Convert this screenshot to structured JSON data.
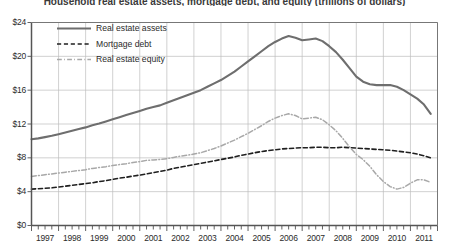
{
  "chart_data": {
    "type": "line",
    "title": "Household real estate assets, mortgage debt, and equity (trillions of dollars)",
    "xlabel": "",
    "ylabel": "",
    "ylim": [
      0,
      24
    ],
    "ytick_labels": [
      "$0",
      "$4",
      "$8",
      "$12",
      "$16",
      "$20",
      "$24"
    ],
    "ytick_values": [
      0,
      4,
      8,
      12,
      16,
      20,
      24
    ],
    "xtick_labels": [
      "1997",
      "1998",
      "1999",
      "2000",
      "2001",
      "2002",
      "2003",
      "2004",
      "2005",
      "2006",
      "2007",
      "2008",
      "2009",
      "2010",
      "2011"
    ],
    "xlim": [
      1997,
      2012
    ],
    "grid": true,
    "minor_ticks_per_year": 4,
    "legend_position": "upper-left-inside",
    "x": [
      1997.0,
      1997.25,
      1997.5,
      1997.75,
      1998.0,
      1998.25,
      1998.5,
      1998.75,
      1999.0,
      1999.25,
      1999.5,
      1999.75,
      2000.0,
      2000.25,
      2000.5,
      2000.75,
      2001.0,
      2001.25,
      2001.5,
      2001.75,
      2002.0,
      2002.25,
      2002.5,
      2002.75,
      2003.0,
      2003.25,
      2003.5,
      2003.75,
      2004.0,
      2004.25,
      2004.5,
      2004.75,
      2005.0,
      2005.25,
      2005.5,
      2005.75,
      2006.0,
      2006.25,
      2006.5,
      2006.75,
      2007.0,
      2007.25,
      2007.5,
      2007.75,
      2008.0,
      2008.25,
      2008.5,
      2008.75,
      2009.0,
      2009.25,
      2009.5,
      2009.75,
      2010.0,
      2010.25,
      2010.5,
      2010.75,
      2011.0,
      2011.25,
      2011.5,
      2011.75
    ],
    "series": [
      {
        "name": "Real estate assets",
        "style": "solid",
        "color": "#6e6e6e",
        "width": 2.1,
        "values": [
          10.2,
          10.3,
          10.45,
          10.6,
          10.8,
          11.0,
          11.2,
          11.4,
          11.6,
          11.85,
          12.05,
          12.3,
          12.55,
          12.8,
          13.05,
          13.3,
          13.55,
          13.8,
          14.0,
          14.2,
          14.5,
          14.8,
          15.1,
          15.4,
          15.7,
          16.0,
          16.4,
          16.8,
          17.2,
          17.7,
          18.2,
          18.8,
          19.4,
          20.0,
          20.6,
          21.2,
          21.7,
          22.1,
          22.4,
          22.2,
          21.9,
          22.0,
          22.1,
          21.8,
          21.2,
          20.5,
          19.6,
          18.6,
          17.6,
          17.0,
          16.7,
          16.6,
          16.6,
          16.6,
          16.4,
          16.0,
          15.5,
          15.0,
          14.3,
          13.2
        ]
      },
      {
        "name": "Mortgage debt",
        "style": "dashed",
        "color": "#1f1f1f",
        "width": 1.6,
        "values": [
          4.3,
          4.35,
          4.4,
          4.45,
          4.55,
          4.65,
          4.75,
          4.85,
          4.95,
          5.05,
          5.2,
          5.3,
          5.45,
          5.6,
          5.7,
          5.85,
          5.95,
          6.1,
          6.25,
          6.4,
          6.55,
          6.75,
          6.9,
          7.05,
          7.2,
          7.35,
          7.5,
          7.65,
          7.8,
          7.95,
          8.1,
          8.3,
          8.45,
          8.6,
          8.75,
          8.85,
          8.95,
          9.05,
          9.1,
          9.15,
          9.2,
          9.2,
          9.25,
          9.25,
          9.2,
          9.2,
          9.25,
          9.2,
          9.15,
          9.1,
          9.05,
          9.0,
          8.95,
          8.9,
          8.8,
          8.7,
          8.6,
          8.45,
          8.25,
          8.0
        ]
      },
      {
        "name": "Real estate equity",
        "style": "dashdot",
        "color": "#a8a8a8",
        "width": 1.5,
        "values": [
          5.8,
          5.9,
          6.0,
          6.1,
          6.2,
          6.3,
          6.4,
          6.5,
          6.6,
          6.75,
          6.85,
          6.95,
          7.1,
          7.2,
          7.3,
          7.45,
          7.55,
          7.7,
          7.75,
          7.8,
          7.9,
          8.05,
          8.2,
          8.3,
          8.45,
          8.6,
          8.85,
          9.1,
          9.4,
          9.75,
          10.1,
          10.5,
          10.9,
          11.35,
          11.8,
          12.3,
          12.7,
          13.0,
          13.2,
          13.0,
          12.6,
          12.7,
          12.8,
          12.5,
          11.9,
          11.2,
          10.3,
          9.3,
          8.4,
          7.8,
          7.0,
          6.0,
          5.2,
          4.6,
          4.3,
          4.5,
          5.0,
          5.4,
          5.4,
          5.1
        ]
      }
    ]
  }
}
